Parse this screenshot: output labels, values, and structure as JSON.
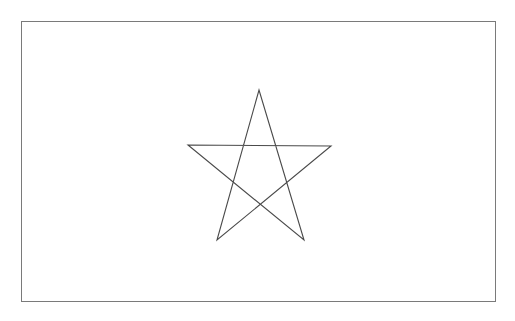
{
  "canvas": {
    "width": 515,
    "height": 321,
    "background_color": "#ffffff",
    "title": "star-drawing"
  },
  "border": {
    "name": "outer-frame",
    "x": 21.5,
    "y": 21.5,
    "width": 474,
    "height": 280,
    "stroke_color": "#7a7a7a",
    "stroke_width": 1.2,
    "fill": "none"
  },
  "shapes": [
    {
      "name": "pentagram-star",
      "type": "star-polygon",
      "schlafli": "{5/2}",
      "points_count": 5,
      "closed": true,
      "stroke_color": "#4a4a4a",
      "stroke_width": 1.1,
      "fill": "none",
      "center_x": 259,
      "center_y": 167,
      "outer_radius": 78,
      "outer_vertices": [
        {
          "label": "top-apex",
          "x": 259,
          "y": 90
        },
        {
          "label": "right-point",
          "x": 331,
          "y": 146
        },
        {
          "label": "bottom-right",
          "x": 304,
          "y": 240
        },
        {
          "label": "bottom-left",
          "x": 217,
          "y": 240
        },
        {
          "label": "left-point",
          "x": 188,
          "y": 145
        }
      ],
      "path": "M 259 90 L 304 240 L 188 145 L 331 146 L 217 240 Z"
    }
  ]
}
